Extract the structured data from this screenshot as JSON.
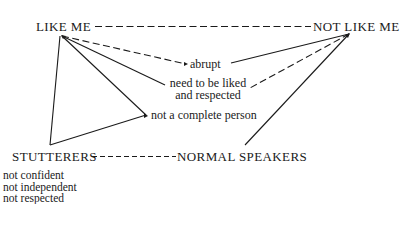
{
  "diagram": {
    "nodes": {
      "like_me": "LIKE ME",
      "not_like_me": "NOT LIKE ME",
      "stutterers": "STUTTERERS",
      "normal_speakers": "NORMAL SPEAKERS"
    },
    "attributes": {
      "abrupt": "abrupt",
      "need_liked_line1": "need to be liked",
      "need_liked_line2": "and respected",
      "not_complete": "not a complete person"
    },
    "stutterer_traits": [
      "not confident",
      "not independent",
      "not respected"
    ],
    "edges": [
      {
        "from": "LIKE ME",
        "to": "NOT LIKE ME",
        "style": "dashed"
      },
      {
        "from": "LIKE ME",
        "to": "abrupt",
        "style": "dashed"
      },
      {
        "from": "LIKE ME",
        "to": "need to be liked and respected",
        "style": "solid"
      },
      {
        "from": "LIKE ME",
        "to": "not a complete person",
        "style": "solid"
      },
      {
        "from": "LIKE ME",
        "to": "STUTTERERS",
        "style": "solid"
      },
      {
        "from": "NOT LIKE ME",
        "to": "abrupt",
        "style": "solid"
      },
      {
        "from": "NOT LIKE ME",
        "to": "need to be liked and respected",
        "style": "dashed"
      },
      {
        "from": "NOT LIKE ME",
        "to": "NORMAL SPEAKERS",
        "style": "solid"
      },
      {
        "from": "STUTTERERS",
        "to": "not a complete person",
        "style": "solid"
      },
      {
        "from": "STUTTERERS",
        "to": "NORMAL SPEAKERS",
        "style": "dashed"
      }
    ],
    "colors": {
      "ink": "#1a1a1a",
      "background": "#ffffff"
    }
  }
}
